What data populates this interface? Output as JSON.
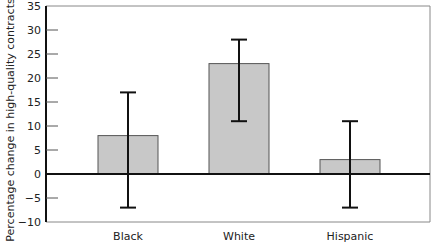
{
  "chart_data": {
    "type": "bar",
    "title": "",
    "xlabel": "",
    "ylabel": "Percentage change in high-quality contracts",
    "categories": [
      "Black",
      "White",
      "Hispanic"
    ],
    "values": [
      8,
      23,
      3
    ],
    "error_bars": [
      {
        "low": -7,
        "high": 17
      },
      {
        "low": 11,
        "high": 28
      },
      {
        "low": -7,
        "high": 11
      }
    ],
    "ylim": [
      -10,
      35
    ],
    "yticks": [
      35,
      30,
      25,
      20,
      15,
      10,
      5,
      0,
      -5,
      -10
    ],
    "ytick_labels": [
      "35",
      "30",
      "25",
      "20",
      "15",
      "10",
      "5",
      "0",
      "−5",
      "−10"
    ],
    "grid": false,
    "legend": null,
    "bar_color": "#c8c8c8",
    "bar_edge_color": "#555555",
    "error_bar_color": "#111111",
    "zero_line_color": "#111111"
  }
}
